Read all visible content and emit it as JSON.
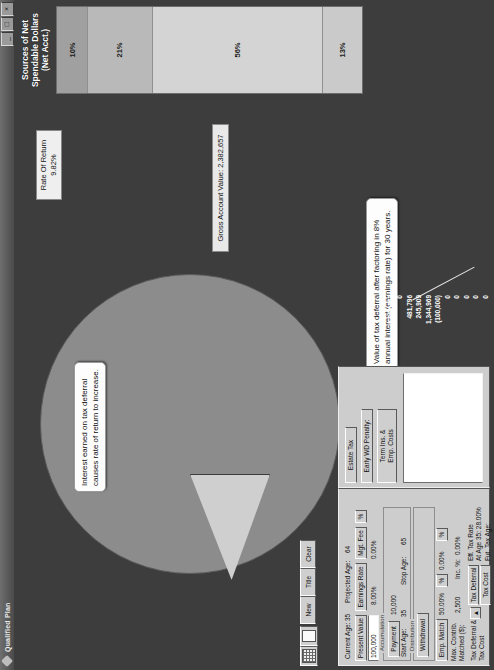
{
  "window": {
    "title": "Qualified Plan",
    "icon": "app-diamond-icon",
    "buttons": {
      "minimize": "_",
      "maximize": "□",
      "close": "×"
    }
  },
  "bar_chart": {
    "title_line1": "Sources of Net",
    "title_line2": "Spendable Dollars",
    "title_line3": "(Net Acct.)"
  },
  "callouts": {
    "interest": "Interest earned on tax deferral causes rate of return to increase.",
    "value": "Value of tax deferral after factoring in 8% annual interest (earnings rate) for 30 years."
  },
  "rate_of_return": {
    "label": "Rate Of Return",
    "value": "9.82%"
  },
  "gross_account": {
    "label": "Gross Account Value:",
    "value": "2,382,657"
  },
  "form": {
    "current_age_label": "Current Age:",
    "current_age_value": "35",
    "projected_age_label": "Projected Age:",
    "projected_age_value": "64",
    "present_value_label": "Present Value",
    "present_value_amount": "100,000",
    "earnings_rate_button": "Earnings Rate",
    "earnings_rate_value": "8.00%",
    "mgt_fee_button": "Mgt. Fee",
    "mgt_fee_value": "0.00%",
    "mgt_fee_pct_button": "%",
    "payment_group": "Payment",
    "payment_value": "10,000",
    "start_age_label": "Start Age:",
    "start_age_value": "35",
    "stop_age_label": "Stop Age:",
    "stop_age_value": "65",
    "withdrawal_button": "Withdrawal",
    "emp_match_button": "Emp. Match",
    "emp_match_value": "50.00%",
    "emp_match_pct_button": "%",
    "emp_match_rate2": "0.00%",
    "emp_match_pct2_button": "%",
    "max_contrib_label_1": "Max. Contrib.",
    "max_contrib_label_2": "Matched ($):",
    "max_contrib_value": "2,500",
    "inc_pct_label": "Inc. %:",
    "inc_pct_value": "0.00%",
    "tax_deferral_cost_label_1": "Tax Deferral &",
    "tax_deferral_cost_label_2": "Tax Cost",
    "spinner_icon": "up-arrow-icon",
    "tax_deferral_button": "Tax Deferral",
    "tax_cost_button": "Tax Cost",
    "eff_tax_rate_label": "Eff. Tax Rate",
    "eff_tax_rate_sub": "At Age 35: 28.00%",
    "fut_tax_age_label": "Fut. Tax Age:",
    "fut_tax_age_value": "",
    "estate_tax_button": "Estate Tax",
    "early_wd_penalty_button": "Early WD Penalty:",
    "term_ins_label_1": "Term Ins. &",
    "term_ins_label_2": "Emp. Costs",
    "sections": {
      "accumulation": "Accumulation",
      "distribution": "Distribution"
    }
  },
  "toolbar": {
    "grid_icon": "grid-icon",
    "page_icon": "page-icon",
    "new_button": "New",
    "title_button": "Title",
    "clear_button": "Clear"
  },
  "chart_data": {
    "type": "bar",
    "title": "Sources of Net Spendable Dollars (Net Acct.)",
    "orientation": "stacked-vertical",
    "categories": [
      "Net Tax Deferral",
      "Net Employer Match",
      "Net Earnings",
      "Net Contributions"
    ],
    "segments": [
      {
        "label": "10%",
        "value": 10,
        "color": "#a0a0a0"
      },
      {
        "label": "21%",
        "value": 21,
        "color": "#b9b9b9"
      },
      {
        "label": "56%",
        "value": 56,
        "color": "#d4d4d4"
      },
      {
        "label": "13%",
        "value": 13,
        "color": "#cacaca"
      }
    ],
    "pie": {
      "type": "pie",
      "slices": [
        {
          "label": "main",
          "value": 88,
          "color": "#8c8c8c"
        },
        {
          "label": "exploded",
          "value": 12,
          "color": "#cfcfcf"
        }
      ]
    },
    "legend_title": "",
    "legend": [
      {
        "name": "Net Account Value",
        "value": "2,382,657",
        "color": "#9b9b9b"
      },
      {
        "name": "Net Withdrawals",
        "value": "0",
        "color": "#8a8a8a"
      },
      {
        "name": "Net Tax Deferral",
        "value": "481,796",
        "color": "#c9c9c9"
      },
      {
        "name": "Net Employer Match",
        "value": "245,909",
        "color": "#aeaeae"
      },
      {
        "name": "Net Earnings",
        "value": "1,344,969",
        "color": "#dddddd"
      },
      {
        "name": "Net Contributions",
        "value": "(100,000)",
        "color": "#e9e9e9"
      },
      {
        "name": "Income Taxes",
        "value": "0",
        "color": "#7e7e7e"
      },
      {
        "name": "Managment Fees",
        "value": "0",
        "color": "#3d3d3d"
      },
      {
        "name": "",
        "value": "0",
        "color": "#cfcfcf"
      },
      {
        "name": "Early WD Penalty",
        "value": "0",
        "color": "#bdbdbd"
      },
      {
        "name": "Estate Tax",
        "value": "0",
        "color": "#a5a5a5"
      }
    ]
  }
}
